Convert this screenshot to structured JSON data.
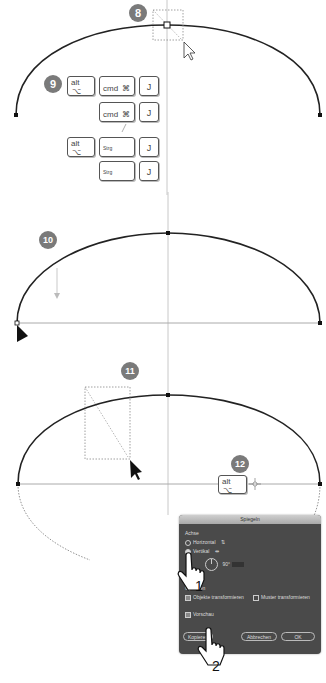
{
  "steps": {
    "step8": "8",
    "step9": "9",
    "step10": "10",
    "step11": "11",
    "step12": "12"
  },
  "shortcuts": {
    "row1": {
      "alt_top": "alt",
      "alt_symbol": "⌥",
      "cmd_label": "cmd",
      "cmd_symbol": "⌘",
      "key": "J"
    },
    "row2": {
      "cmd_label": "cmd",
      "cmd_symbol": "⌘",
      "key": "J"
    },
    "separator": "/",
    "row3": {
      "alt_top": "alt",
      "alt_symbol": "⌥",
      "ctrl_label": "Strg",
      "key": "J"
    },
    "row4": {
      "ctrl_label": "Strg",
      "key": "J"
    }
  },
  "step12_key": {
    "alt_top": "alt",
    "alt_symbol": "⌥"
  },
  "dialog": {
    "title": "Spiegeln",
    "axis_section": "Achse",
    "horizontal_label": "Horizontal",
    "vertical_label": "Vertikal",
    "angle_value": "90°",
    "options_section": "Optionen",
    "transform_objects": "Objekte transformieren",
    "transform_patterns": "Muster transformieren",
    "preview_label": "Vorschau",
    "copy_button": "Kopieren",
    "cancel_button": "Abbrechen",
    "ok_button": "OK"
  },
  "hand_annotations": {
    "first": "1",
    "second": "2"
  },
  "colors": {
    "badge": "#7a7a7a",
    "curve": "#222222",
    "guide": "#bbbbbb",
    "dialog_bg": "#4a4a4a"
  }
}
